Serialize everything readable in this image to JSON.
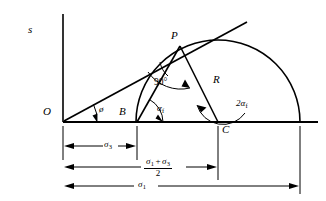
{
  "figure": {
    "type": "mohr-circle-diagram",
    "axis_label": "s",
    "points": {
      "origin": "O",
      "tangent_point": "P",
      "circle_left": "B",
      "circle_center": "C"
    },
    "angles": {
      "at_origin": "ø",
      "right_angle": "90°",
      "at_B": "α",
      "at_B_sub": "f",
      "at_C_coef": "2",
      "at_C": "α",
      "at_C_sub": "f"
    },
    "radius_label": "R",
    "dimensions": [
      {
        "name": "sigma3",
        "symbol": "σ",
        "subscript": "3",
        "kind": "plain"
      },
      {
        "name": "sigma-mean",
        "kind": "fraction",
        "numerator_left_symbol": "σ",
        "numerator_left_sub": "1",
        "numerator_operator": "+",
        "numerator_right_symbol": "σ",
        "numerator_right_sub": "3",
        "denominator": "2"
      },
      {
        "name": "sigma1",
        "symbol": "σ",
        "subscript": "1",
        "kind": "plain"
      }
    ],
    "colors": {
      "stroke": "#000000",
      "background": "#ffffff"
    }
  }
}
